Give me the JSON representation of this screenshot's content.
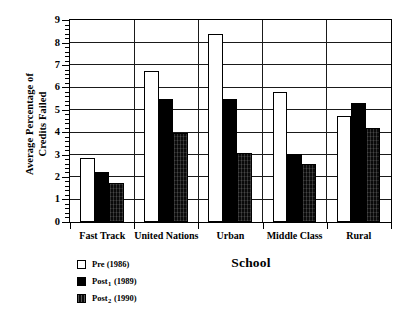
{
  "chart_data": {
    "type": "bar",
    "title": "",
    "xlabel": "School",
    "ylabel": "Average Percentage of Credits Failed",
    "ylabel_line1": "Average Percentage of",
    "ylabel_line2": "Credits Failed",
    "categories": [
      "Fast Track",
      "United Nations",
      "Urban",
      "Middle Class",
      "Rural"
    ],
    "series": [
      {
        "name": "Pre (1986)",
        "label_main": "Pre",
        "label_sub": "",
        "label_year": "(1986)",
        "fill": "white",
        "color": "#ffffff",
        "values": [
          2.85,
          6.75,
          8.4,
          5.8,
          4.75
        ]
      },
      {
        "name": "Post1 (1989)",
        "label_main": "Post",
        "label_sub": "1",
        "label_year": "(1989)",
        "fill": "solid-black",
        "color": "#000000",
        "values": [
          2.25,
          5.5,
          5.5,
          3.05,
          5.3
        ]
      },
      {
        "name": "Post2 (1990)",
        "label_main": "Post",
        "label_sub": "2",
        "label_year": "(1990)",
        "fill": "dense-pattern",
        "color": "#0a0a0a",
        "values": [
          1.75,
          4.0,
          3.1,
          2.6,
          4.2
        ]
      }
    ],
    "ylim": [
      0,
      9
    ],
    "ytick_labels": [
      "0",
      "1",
      "2",
      "3",
      "4",
      "5",
      "6",
      "7",
      "8",
      "9"
    ],
    "ytick_values": [
      0,
      1,
      2,
      3,
      4,
      5,
      6,
      7,
      8,
      9
    ],
    "y_minor_step": 0.2,
    "grid": "horizontal-major",
    "legend_position": "below-left",
    "group_separators": true,
    "axis_color": "#000000"
  }
}
